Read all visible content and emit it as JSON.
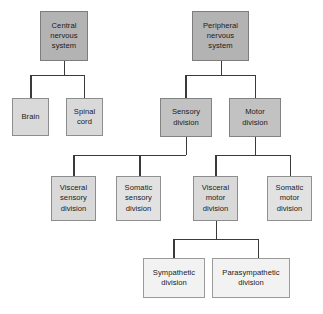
{
  "diagram": {
    "type": "hierarchy-tree",
    "colors": {
      "box_dark": "#b3b3b3",
      "box_mid": "#c2c2c2",
      "box_light": "#d9d9d9",
      "box_lighter": "#e2e2e2",
      "box_pale": "#f2f2f2",
      "connector": "#3a3a3a",
      "border": "#8a8a8a",
      "background": "#ffffff",
      "text": "#1a1a1a"
    },
    "nodes": {
      "central_nervous_system": "Central\nnervous\nsystem",
      "peripheral_nervous_system": "Peripheral\nnervous\nsystem",
      "brain": "Brain",
      "spinal_cord": "Spinal\ncord",
      "sensory_division": "Sensory\ndivision",
      "motor_division": "Motor\ndivision",
      "visceral_sensory_division": "Visceral\nsensory\ndivision",
      "somatic_sensory_division": "Somatic\nsensory\ndivision",
      "visceral_motor_division": "Visceral\nmotor\ndivision",
      "somatic_motor_division": "Somatic\nmotor\ndivision",
      "sympathetic_division": "Sympathetic\ndivision",
      "parasympathetic_division": "Parasympathetic\ndivision"
    },
    "levels": [
      [
        "Central nervous system",
        "Peripheral nervous system"
      ],
      [
        "Brain",
        "Spinal cord",
        "Sensory division",
        "Motor division"
      ],
      [
        "Visceral sensory division",
        "Somatic sensory division",
        "Visceral motor division",
        "Somatic motor division"
      ],
      [
        "Sympathetic division",
        "Parasympathetic division"
      ]
    ],
    "edges": [
      {
        "from": "Central nervous system",
        "to": "Brain"
      },
      {
        "from": "Central nervous system",
        "to": "Spinal cord"
      },
      {
        "from": "Peripheral nervous system",
        "to": "Sensory division"
      },
      {
        "from": "Peripheral nervous system",
        "to": "Motor division"
      },
      {
        "from": "Sensory division",
        "to": "Visceral sensory division"
      },
      {
        "from": "Sensory division",
        "to": "Somatic sensory division"
      },
      {
        "from": "Motor division",
        "to": "Visceral motor division"
      },
      {
        "from": "Motor division",
        "to": "Somatic motor division"
      },
      {
        "from": "Visceral motor division",
        "to": "Sympathetic division"
      },
      {
        "from": "Visceral motor division",
        "to": "Parasympathetic division"
      }
    ]
  }
}
